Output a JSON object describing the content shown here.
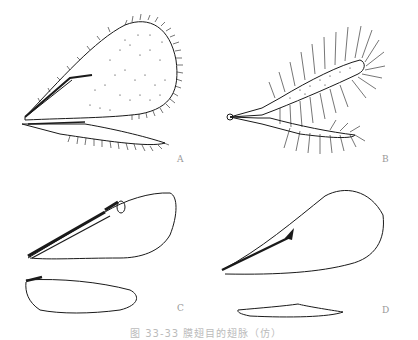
{
  "figure": {
    "panels": [
      {
        "label": "A",
        "description": "forewing and hindwing with dense marginal fringe, stigmal vein"
      },
      {
        "label": "B",
        "description": "narrow fringed forewing and hindwing (long marginal setae)"
      },
      {
        "label": "C",
        "description": "forewing with thick costal vein and stigma; hindwing"
      },
      {
        "label": "D",
        "description": "teardrop forewing with short stigmal vein; narrow hindwing"
      }
    ],
    "caption": "图 33-33  膜翅目的翅脉（仿）"
  },
  "colors": {
    "ink": "#1a1a1a",
    "label": "#999999",
    "background": "#ffffff"
  }
}
